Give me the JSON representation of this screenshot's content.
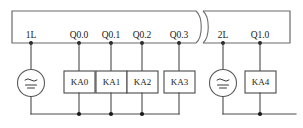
{
  "diagram": {
    "type": "electrical-schematic",
    "colors": {
      "wire": "#4a4a4a",
      "enclosure": "#6b6b6b",
      "node": "#1a1a1a",
      "text": "#1a1a1a",
      "background": "#ffffff"
    },
    "break_symbol": "double-arc-break",
    "groups": [
      {
        "name": "group-1",
        "common_terminal": "1L",
        "source_symbol": "ac-dc-source",
        "terminals": [
          {
            "label": "Q0.0",
            "relay": "KA0"
          },
          {
            "label": "Q0.1",
            "relay": "KA1"
          },
          {
            "label": "Q0.2",
            "relay": "KA2"
          },
          {
            "label": "Q0.3",
            "relay": "KA3"
          }
        ]
      },
      {
        "name": "group-2",
        "common_terminal": "2L",
        "source_symbol": "ac-dc-source",
        "terminals": [
          {
            "label": "Q1.0",
            "relay": "KA4"
          }
        ]
      }
    ],
    "labels": {
      "t_1L": "1L",
      "t_q00": "Q0.0",
      "t_q01": "Q0.1",
      "t_q02": "Q0.2",
      "t_q03": "Q0.3",
      "t_2L": "2L",
      "t_q10": "Q1.0",
      "r_ka0": "KA0",
      "r_ka1": "KA1",
      "r_ka2": "KA2",
      "r_ka3": "KA3",
      "r_ka4": "KA4"
    }
  }
}
